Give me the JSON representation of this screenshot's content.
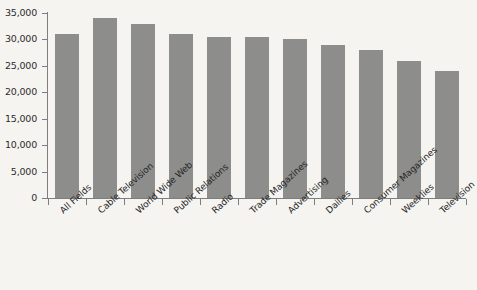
{
  "chart_data": {
    "type": "bar",
    "title": "",
    "subtitle": "",
    "xlabel": "",
    "ylabel": "",
    "ylim": [
      0,
      35000
    ],
    "ytick_values": [
      0,
      5000,
      10000,
      15000,
      20000,
      25000,
      30000,
      35000
    ],
    "ytick_labels": [
      "0",
      "5,000",
      "10,000",
      "15,000",
      "20,000",
      "25,000",
      "30,000",
      "35,000"
    ],
    "grid": false,
    "legend": null,
    "bar_color": "#8d8d8b",
    "background_color": "#f5f4f1",
    "axis_color": "#7e7e7c",
    "categories": [
      "All Fields",
      "Cable Television",
      "World Wide Web",
      "Public Relations",
      "Radio",
      "Trade Magazines",
      "Advertising",
      "Dailies",
      "Consumer Magazines",
      "Weeklies",
      "Television"
    ],
    "values": [
      31000,
      34000,
      33000,
      31000,
      30500,
      30500,
      30000,
      29000,
      28000,
      26000,
      24000
    ]
  }
}
